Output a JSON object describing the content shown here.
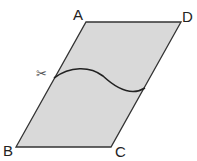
{
  "diagram": {
    "shape": "parallelogram",
    "fill": "#d9d9d9",
    "stroke": "#333333",
    "vertices": {
      "A": {
        "label": "A",
        "x": 86,
        "y": 22
      },
      "D": {
        "label": "D",
        "x": 181,
        "y": 22
      },
      "C": {
        "label": "C",
        "x": 111,
        "y": 147
      },
      "B": {
        "label": "B",
        "x": 16,
        "y": 147
      }
    },
    "cut_curve": {
      "from": [
        54,
        78
      ],
      "to": [
        145,
        88
      ]
    },
    "scissors_icon": "✂"
  }
}
